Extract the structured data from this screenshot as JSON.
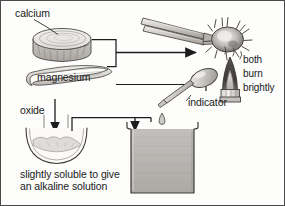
{
  "diagram": {
    "labels": {
      "calcium": "calcium",
      "magnesium": "magnesium",
      "both": "both",
      "burn": "burn",
      "brightly": "brightly",
      "oxide": "oxide",
      "indicator": "indicator",
      "soluble_line1": "slightly soluble to give",
      "soluble_line2": "an alkaline solution"
    },
    "icons": {
      "calcium_lump": "calcium-disc-icon",
      "magnesium_ribbon": "magnesium-ribbon-icon",
      "tongs": "tongs-icon",
      "burning_sample": "burning-sample-icon",
      "bunsen_flame": "bunsen-burner-flame-icon",
      "evaporating_dish": "evaporating-dish-icon",
      "dropper": "dropper-pipette-icon",
      "beaker": "beaker-icon",
      "arrow_to_flame": "arrow-right-icon",
      "arrow_to_dish": "arrow-down-icon",
      "arrow_to_beaker": "arrow-down-icon"
    },
    "colors": {
      "ink": "#1a1a1a",
      "line": "#333333",
      "border": "#4a4a4a",
      "metal_fill": "#e8e6e3",
      "metal_shade": "#bdbab6",
      "flame_dark": "#4d4a48",
      "flame_inner": "#cfcccа",
      "liquid_fill": "#b9b7b4",
      "background": "#fdfdfc"
    }
  }
}
